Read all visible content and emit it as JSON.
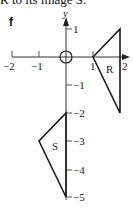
{
  "caption": "R to its image S.",
  "part_label": "f",
  "axes": {
    "x_label": "x",
    "y_label": "y",
    "x_ticks": [
      "−2",
      "−1",
      "1",
      "2"
    ],
    "y_ticks": [
      "1",
      "−1",
      "−2",
      "−3",
      "−4",
      "−5"
    ]
  },
  "shapes": [
    {
      "name": "R",
      "vertices": [
        [
          1,
          0
        ],
        [
          2,
          1
        ],
        [
          2,
          -2
        ]
      ]
    },
    {
      "name": "S",
      "vertices": [
        [
          0,
          -2
        ],
        [
          0,
          -5
        ],
        [
          -1,
          -3
        ]
      ]
    }
  ],
  "center_of_rotation": [
    0,
    0
  ],
  "colors": {
    "line": "#1a1a1a",
    "axis": "#333333"
  }
}
